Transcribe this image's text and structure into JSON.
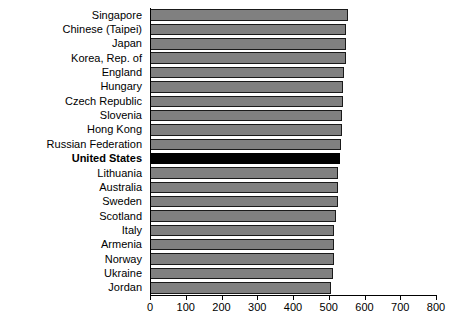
{
  "chart_data": {
    "type": "bar",
    "orientation": "horizontal",
    "title": "",
    "subtitle": "",
    "xlabel": "",
    "ylabel": "",
    "xlim": [
      0,
      800
    ],
    "ylim": null,
    "grid": false,
    "legend": null,
    "xticks": [
      0,
      100,
      200,
      300,
      400,
      500,
      600,
      700,
      800
    ],
    "xtick_labels": [
      "0",
      "100",
      "200",
      "300",
      "400",
      "500",
      "600",
      "700",
      "800"
    ],
    "categories": [
      "Singapore",
      "Chinese (Taipei)",
      "Japan",
      "Korea, Rep. of",
      "England",
      "Hungary",
      "Czech Republic",
      "Slovenia",
      "Hong Kong",
      "Russian Federation",
      "United States",
      "Lithuania",
      "Australia",
      "Sweden",
      "Scotland",
      "Italy",
      "Armenia",
      "Norway",
      "Ukraine",
      "Jordan"
    ],
    "values": [
      553,
      549,
      548,
      548,
      542,
      539,
      539,
      538,
      536,
      534,
      532,
      527,
      527,
      525,
      520,
      516,
      516,
      516,
      512,
      506
    ],
    "highlight_category": "United States",
    "colors": {
      "bar": "#808080",
      "bar_edge": "#1a1a1a",
      "highlight_bar": "#000000",
      "axis": "#000000",
      "text": "#000000",
      "background": "#ffffff"
    }
  }
}
